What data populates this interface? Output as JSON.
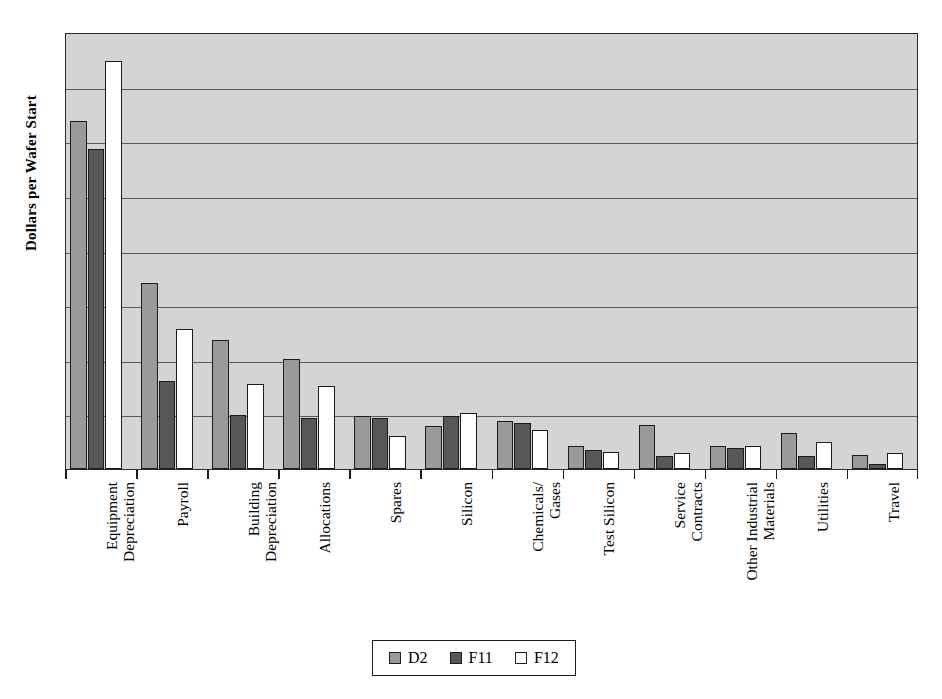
{
  "chart_data": {
    "type": "bar",
    "title": "",
    "subtitle": "",
    "xlabel": "",
    "ylabel": "Dollars per Wafer Start",
    "orientation": "vertical",
    "grouping": "grouped",
    "grid": "horizontal",
    "y_axis_tick_labels_shown": false,
    "y_gridline_count": 8,
    "ylim": [
      0,
      8
    ],
    "plot_background_color": "#d4d4d4",
    "legend_position": "bottom-center",
    "categories": [
      "Equipment Depreciation",
      "Payroll",
      "Building Depreciation",
      "Allocations",
      "Spares",
      "Silicon",
      "Chemicals/ Gases",
      "Test Silicon",
      "Service Contracts",
      "Other Industrial Materials",
      "Utilities",
      "Travel"
    ],
    "category_lines": [
      [
        "Equipment",
        "Depreciation"
      ],
      [
        "Payroll",
        ""
      ],
      [
        "Building",
        "Depreciation"
      ],
      [
        "Allocations",
        ""
      ],
      [
        "Spares",
        ""
      ],
      [
        "Silicon",
        ""
      ],
      [
        "Chemicals/",
        "Gases"
      ],
      [
        "Test Silicon",
        ""
      ],
      [
        "Service",
        "Contracts"
      ],
      [
        "Other Industrial",
        "Materials"
      ],
      [
        "Utilities",
        ""
      ],
      [
        "Travel",
        ""
      ]
    ],
    "series": [
      {
        "name": "D2",
        "color": "#9a9a9a",
        "values": [
          6.38,
          3.41,
          2.37,
          2.01,
          0.97,
          0.79,
          0.88,
          0.42,
          0.8,
          0.43,
          0.66,
          0.25
        ]
      },
      {
        "name": "F11",
        "color": "#575757",
        "values": [
          5.86,
          1.61,
          0.98,
          0.93,
          0.93,
          0.97,
          0.84,
          0.34,
          0.23,
          0.38,
          0.24,
          0.09
        ]
      },
      {
        "name": "F12",
        "color": "#ffffff",
        "values": [
          7.47,
          2.56,
          1.56,
          1.52,
          0.6,
          1.03,
          0.71,
          0.31,
          0.29,
          0.43,
          0.49,
          0.29
        ]
      }
    ]
  },
  "legend": {
    "entries": [
      {
        "label": "D2",
        "color": "#9a9a9a"
      },
      {
        "label": "F11",
        "color": "#575757"
      },
      {
        "label": "F12",
        "color": "#ffffff"
      }
    ]
  },
  "axes": {
    "y_title": "Dollars per Wafer Start"
  }
}
